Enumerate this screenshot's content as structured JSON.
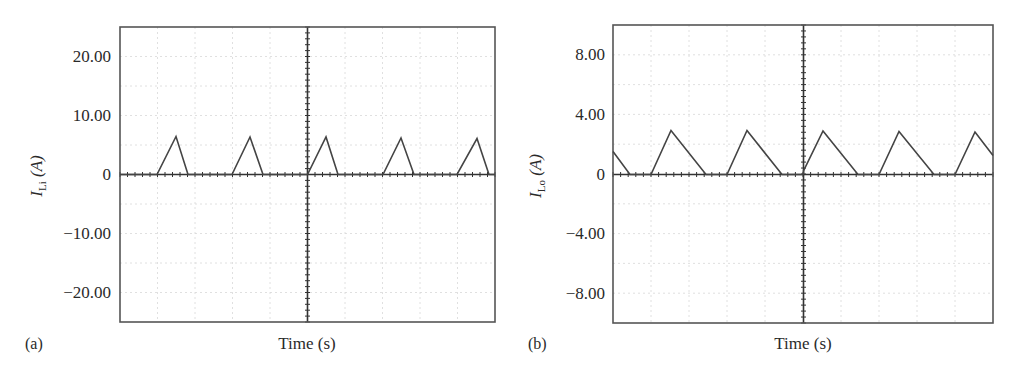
{
  "chart_data": [
    {
      "panel": "(a)",
      "type": "line",
      "title": "",
      "xlabel": "Time (s)",
      "ylabel": "I_Li (A)",
      "ylabel_main": "I",
      "ylabel_sub": "Li",
      "ylabel_unit": " (A)",
      "ylim": [
        -25,
        25
      ],
      "yticks": [
        20,
        10,
        0,
        -10,
        -20
      ],
      "ytick_labels": [
        "20.00",
        "10.00",
        "0",
        "-10.00",
        "-20.00"
      ],
      "xticks_labeled": false,
      "grid": true,
      "series": [
        {
          "name": "I_Li",
          "description": "Discontinuous triangular inductor current pulses, peak ≈ 6.4 A, 5 pulses in window",
          "x_fraction": [
            0.0,
            0.098,
            0.149,
            0.181,
            0.298,
            0.346,
            0.381,
            0.498,
            0.549,
            0.581,
            0.698,
            0.746,
            0.781,
            0.895,
            0.949,
            0.981,
            1.0
          ],
          "values": [
            0,
            0,
            6.4,
            0,
            0,
            6.3,
            0,
            0,
            6.3,
            0,
            0,
            6.2,
            0,
            0,
            6.1,
            0,
            0
          ]
        }
      ]
    },
    {
      "panel": "(b)",
      "type": "line",
      "title": "",
      "xlabel": "Time (s)",
      "ylabel": "I_Lo (A)",
      "ylabel_main": "I",
      "ylabel_sub": "Lo",
      "ylabel_unit": " (A)",
      "ylim": [
        -10,
        10
      ],
      "yticks": [
        8,
        4,
        0,
        -4,
        -8
      ],
      "ytick_labels": [
        "8.00",
        "4.00",
        "0",
        "-4.00",
        "-8.00"
      ],
      "xticks_labeled": false,
      "grid": true,
      "series": [
        {
          "name": "I_Lo",
          "description": "Discontinuous sawtooth output inductor current, peak ≈ 2.9 A, slow linear fall",
          "x_fraction": [
            0.0,
            0.045,
            0.1,
            0.15,
            0.242,
            0.3,
            0.35,
            0.443,
            0.5,
            0.55,
            0.642,
            0.7,
            0.75,
            0.842,
            0.9,
            0.95,
            1.0
          ],
          "values": [
            1.5,
            0,
            0,
            2.9,
            0,
            0,
            2.9,
            0,
            0.1,
            2.9,
            0,
            0,
            2.8,
            0,
            0,
            2.8,
            1.3
          ]
        }
      ]
    }
  ],
  "panels": {
    "a": {
      "label": "(a)",
      "xlabel": "Time (s)",
      "ylabel_main": "I",
      "ylabel_sub": "Li",
      "ylabel_unit": " (A)",
      "ticks": [
        "20.00",
        "10.00",
        "0",
        "−10.00",
        "−20.00"
      ]
    },
    "b": {
      "label": "(b)",
      "xlabel": "Time (s)",
      "ylabel_main": "I",
      "ylabel_sub": "Lo",
      "ylabel_unit": " (A)",
      "ticks": [
        "8.00",
        "4.00",
        "0",
        "−4.00",
        "−8.00"
      ]
    }
  },
  "colors": {
    "trace": "#444444",
    "frame": "#555555",
    "grid": "#d8d8d8",
    "text": "#2a2a2a"
  }
}
